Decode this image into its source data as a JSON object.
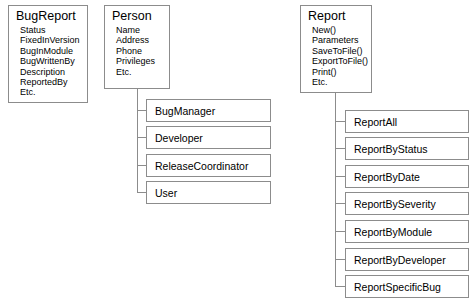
{
  "diagram": {
    "background_color": "#ffffff",
    "border_color": "#8c8c8c",
    "text_color": "#000000"
  },
  "classes": {
    "bug_report": {
      "name": "BugReport",
      "members": [
        "Status",
        "FixedInVersion",
        "BugInModule",
        "BugWrittenBy",
        "Description",
        "ReportedBy",
        "Etc."
      ]
    },
    "person": {
      "name": "Person",
      "members": [
        "Name",
        "Address",
        "Phone",
        "Privileges",
        "Etc."
      ]
    },
    "report": {
      "name": "Report",
      "members": [
        "New()",
        "Parameters",
        "SaveToFile()",
        "ExportToFile()",
        "Print()",
        "Etc."
      ]
    }
  },
  "person_subclasses": [
    {
      "name": "BugManager"
    },
    {
      "name": "Developer"
    },
    {
      "name": "ReleaseCoordinator"
    },
    {
      "name": "User"
    }
  ],
  "report_subclasses": [
    {
      "name": "ReportAll"
    },
    {
      "name": "ReportByStatus"
    },
    {
      "name": "ReportByDate"
    },
    {
      "name": "ReportBySeverity"
    },
    {
      "name": "ReportByModule"
    },
    {
      "name": "ReportByDeveloper"
    },
    {
      "name": "ReportSpecificBug"
    }
  ]
}
